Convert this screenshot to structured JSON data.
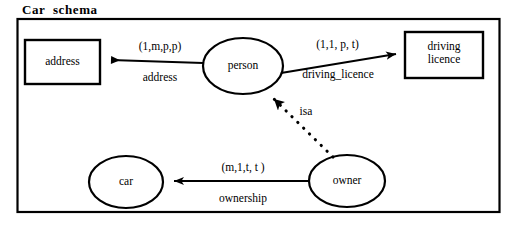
{
  "diagram": {
    "title": "Car  schema",
    "frame": {
      "stroke_color": "#000000"
    },
    "entities": [
      {
        "id": "address",
        "label": "address",
        "shape": "rectangle"
      },
      {
        "id": "driving_licence",
        "label": "driving\nlicence",
        "shape": "rectangle"
      },
      {
        "id": "person",
        "label": "person",
        "shape": "ellipse"
      },
      {
        "id": "car",
        "label": "car",
        "shape": "ellipse"
      },
      {
        "id": "owner",
        "label": "owner",
        "shape": "ellipse"
      }
    ],
    "relationships": [
      {
        "id": "address-rel",
        "from": "person",
        "to": "address",
        "cardinality": "(1,m,p,p)",
        "name": "address",
        "style": "solid",
        "arrow": "filled"
      },
      {
        "id": "driving-licence-rel",
        "from": "person",
        "to": "driving_licence",
        "cardinality": "(1,1, p, t)",
        "name": "driving_licence",
        "style": "solid",
        "arrow": "filled"
      },
      {
        "id": "ownership-rel",
        "from": "owner",
        "to": "car",
        "cardinality": "(m,1,t, t )",
        "name": "ownership",
        "style": "solid",
        "arrow": "filled"
      },
      {
        "id": "isa-rel",
        "from": "owner",
        "to": "person",
        "cardinality": "",
        "name": "isa",
        "style": "dotted",
        "arrow": "filled"
      }
    ]
  }
}
